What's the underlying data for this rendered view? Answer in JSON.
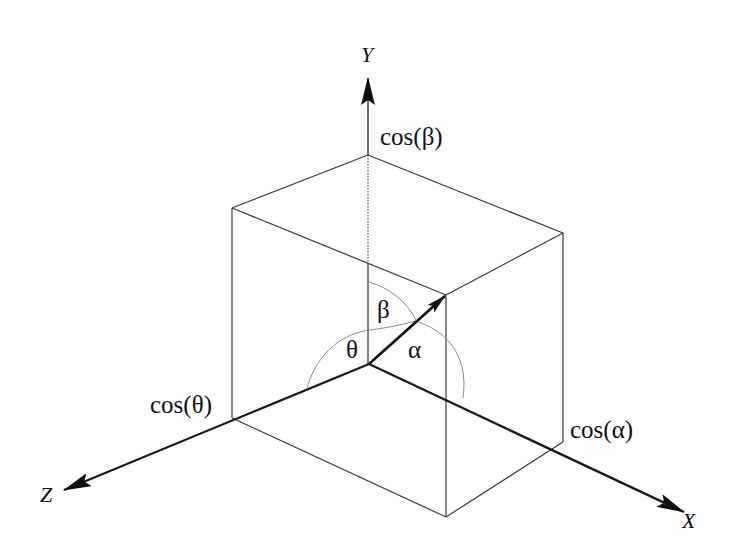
{
  "diagram": {
    "axes": {
      "x": {
        "label": "X"
      },
      "y": {
        "label": "Y"
      },
      "z": {
        "label": "Z"
      }
    },
    "cosine_labels": {
      "alpha": "cos(α)",
      "beta": "cos(β)",
      "theta": "cos(θ)"
    },
    "angle_labels": {
      "alpha": "α",
      "beta": "β",
      "theta": "θ"
    },
    "colors": {
      "line": "#1a1a1a",
      "thin_line": "#3a3a3a",
      "arc": "#8a8a8a",
      "background": "#ffffff"
    }
  }
}
